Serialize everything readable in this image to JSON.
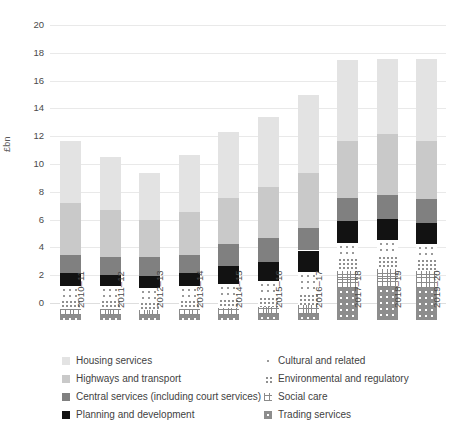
{
  "chart_data": {
    "type": "bar",
    "subtype": "stacked-bar",
    "title": "",
    "xlabel": "",
    "ylabel": "£bn",
    "ylim": [
      0,
      20
    ],
    "ytick_step": 2,
    "yticks": [
      "20",
      "18",
      "16",
      "14",
      "12",
      "10",
      "8",
      "6",
      "4",
      "2",
      "0"
    ],
    "grid": true,
    "grid_axis": "y",
    "legend_position": "bottom",
    "categories": [
      "2010–11",
      "2011–12",
      "2012–13",
      "2013–14",
      "2014–15",
      "2015–16",
      "2016–17",
      "2017–18",
      "2018–19",
      "2019–20"
    ],
    "series": [
      {
        "name": "Trading services",
        "fill": "trading",
        "values": [
          0.35,
          0.35,
          0.35,
          0.35,
          0.35,
          0.4,
          0.45,
          2.3,
          2.35,
          2.3
        ]
      },
      {
        "name": "Social care",
        "fill": "social",
        "values": [
          0.45,
          0.45,
          0.4,
          0.45,
          0.5,
          0.55,
          0.6,
          1.25,
          1.35,
          1.2
        ]
      },
      {
        "name": "Environmental and regulatory",
        "fill": "environ",
        "values": [
          0.7,
          0.7,
          0.65,
          0.7,
          0.75,
          0.8,
          0.9,
          0.95,
          1.0,
          0.95
        ]
      },
      {
        "name": "Cultural and related",
        "fill": "cultural",
        "values": [
          0.95,
          0.95,
          0.9,
          0.95,
          1.0,
          1.05,
          1.5,
          1.05,
          1.05,
          1.05
        ]
      },
      {
        "name": "Planning and development",
        "fill": "planning",
        "values": [
          0.9,
          0.8,
          0.9,
          0.9,
          1.3,
          1.4,
          1.55,
          1.55,
          1.5,
          1.45
        ]
      },
      {
        "name": "Central services (including court services)",
        "fill": "central",
        "values": [
          1.3,
          1.25,
          1.3,
          1.35,
          1.6,
          1.7,
          1.6,
          1.7,
          1.75,
          1.75
        ]
      },
      {
        "name": "Highways and transport",
        "fill": "highways",
        "values": [
          3.8,
          3.4,
          2.7,
          3.1,
          3.3,
          3.7,
          4.0,
          4.1,
          4.4,
          4.2
        ]
      },
      {
        "name": "Housing services",
        "fill": "housing",
        "values": [
          4.45,
          3.8,
          3.4,
          4.1,
          4.7,
          5.0,
          5.6,
          5.8,
          5.4,
          5.9
        ]
      }
    ],
    "totals": [
      12.9,
      11.7,
      10.6,
      11.9,
      13.5,
      14.6,
      16.2,
      18.7,
      18.8,
      18.8
    ]
  },
  "legend": {
    "left": [
      {
        "label": "Housing services",
        "fill": "housing"
      },
      {
        "label": "Highways and transport",
        "fill": "highways"
      },
      {
        "label": "Central services (including court services)",
        "fill": "central"
      },
      {
        "label": "Planning and development",
        "fill": "planning"
      }
    ],
    "right": [
      {
        "label": "Cultural and related",
        "fill": "cultural"
      },
      {
        "label": "Environmental and regulatory",
        "fill": "environ"
      },
      {
        "label": "Social care",
        "fill": "social"
      },
      {
        "label": "Trading services",
        "fill": "trading"
      }
    ]
  },
  "colors": {
    "housing": "#e3e3e3",
    "highways": "#c9c9c9",
    "central": "#808080",
    "planning": "#121212",
    "trading": "#8d8d8d",
    "gridline": "#e9e9e9",
    "text": "#3f3f3f"
  },
  "caption": ""
}
